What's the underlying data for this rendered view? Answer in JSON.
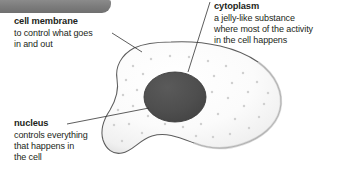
{
  "figure": {
    "type": "biology-cell-diagram",
    "background_color": "#ffffff",
    "text_color": "#231f20",
    "banner": {
      "name": "decorative-gray-tab",
      "color": "#7d7d7d"
    }
  },
  "cell": {
    "membrane_outline_color": "#555555",
    "cytoplasm_fill_color": "#fafafa",
    "cytoplasm_shade_color": "#e6e6e6",
    "nucleus_fill_color": "#4d4d4d",
    "nucleus_outline_color": "#3a3a3a",
    "stipple_dot_color": "#d2d2d2"
  },
  "labels": [
    {
      "id": "cell-membrane",
      "title": "cell membrane",
      "lines": [
        "to control what goes",
        "in and out"
      ]
    },
    {
      "id": "cytoplasm",
      "title": "cytoplasm",
      "lines": [
        "a jelly-like substance",
        "where most of the activity",
        "in the cell happens"
      ]
    },
    {
      "id": "nucleus",
      "title": "nucleus",
      "lines": [
        "controls everything",
        "that happens in",
        "the cell"
      ]
    }
  ]
}
